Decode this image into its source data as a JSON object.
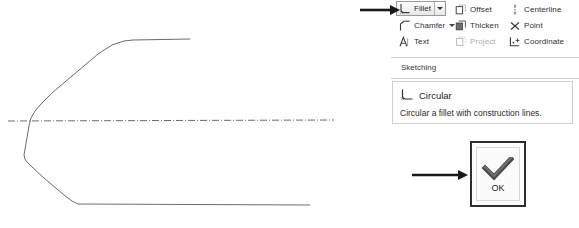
{
  "ribbon": {
    "rows": [
      {
        "items": [
          {
            "label": "Fillet",
            "icon": "fillet-icon",
            "state": "selected",
            "has_dropdown": true
          },
          {
            "label": "Offset",
            "icon": "offset-icon",
            "state": "normal",
            "has_dropdown": false
          },
          {
            "label": "Centerline",
            "icon": "centerline-icon",
            "state": "normal",
            "has_dropdown": false
          }
        ]
      },
      {
        "items": [
          {
            "label": "Chamfer",
            "icon": "chamfer-icon",
            "state": "normal",
            "has_dropdown": true
          },
          {
            "label": "Thicken",
            "icon": "thicken-icon",
            "state": "normal",
            "has_dropdown": false
          },
          {
            "label": "Point",
            "icon": "point-icon",
            "state": "normal",
            "has_dropdown": false
          }
        ]
      },
      {
        "items": [
          {
            "label": "Text",
            "icon": "text-icon",
            "state": "normal",
            "has_dropdown": false
          },
          {
            "label": "Project",
            "icon": "project-icon",
            "state": "disabled",
            "has_dropdown": false
          },
          {
            "label": "Coordinate",
            "icon": "coordinate-icon",
            "state": "normal",
            "has_dropdown": false
          }
        ]
      }
    ]
  },
  "panel": {
    "title": "Sketching"
  },
  "tooltip": {
    "title": "Circular",
    "icon": "fillet-icon",
    "description": "Circular a fillet with construction lines."
  },
  "dialog": {
    "ok_label": "OK",
    "ok_icon": "checkmark-icon"
  },
  "annotations": {
    "arrow_to_fillet": "arrow-right-icon",
    "arrow_to_ok": "arrow-right-icon"
  },
  "sketch": {
    "profile_points": "24,155 30,121 34,113 38,108 46,99 61,85 96,55 112,46 132,41 190,40",
    "profile_lower_points": "24,155 26,160 28,162 46,180 72,199 80,205 310,206",
    "centerline_y": 121,
    "centerline_start_x": 8,
    "centerline_end_x": 334,
    "line_color": "#555555",
    "centerline_color": "#444444"
  }
}
